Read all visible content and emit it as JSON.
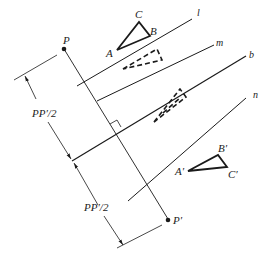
{
  "figure": {
    "points": {
      "P": {
        "label": "P"
      },
      "P_prime": {
        "label": "P′"
      }
    },
    "lines": {
      "l": {
        "label": "l"
      },
      "m": {
        "label": "m"
      },
      "b": {
        "label": "b"
      },
      "n": {
        "label": "n"
      }
    },
    "triangle_original": {
      "A": "A",
      "B": "B",
      "C": "C"
    },
    "triangle_image": {
      "A": "A′",
      "B": "B′",
      "C": "C′"
    },
    "dimensions": {
      "upper": "PP′/2",
      "lower": "PP′/2"
    },
    "colors": {
      "stroke": "#1a1a1a",
      "background": "#ffffff"
    }
  }
}
